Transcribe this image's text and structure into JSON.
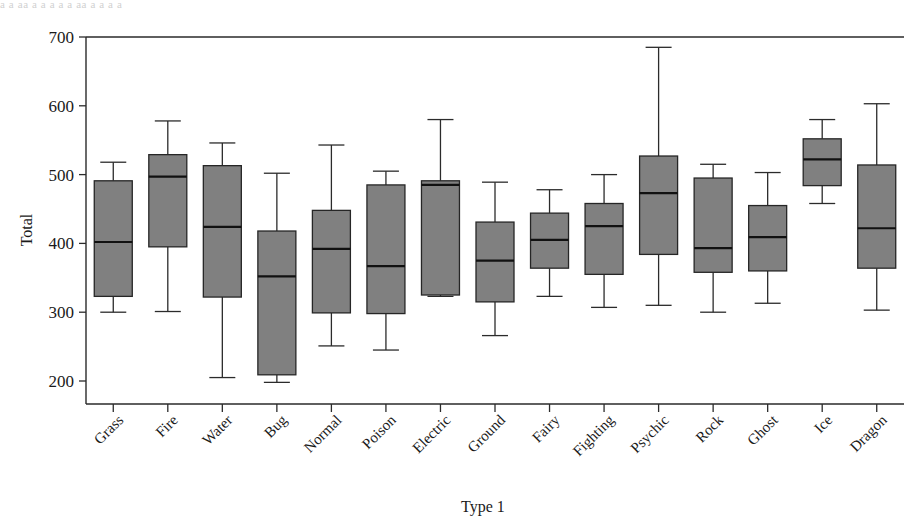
{
  "figure": {
    "top_partial_text": "a a aa a a   a  a  a  aa   a a  a   a",
    "background_color": "#ffffff",
    "box_fill_color": "#808080",
    "line_color": "#2b2b2b"
  },
  "chart_data": {
    "type": "box",
    "title": "",
    "xlabel": "Type 1",
    "ylabel": "Total",
    "ylim": [
      180,
      700
    ],
    "yticks": [
      200,
      300,
      400,
      500,
      600,
      700
    ],
    "ytick_labels": [
      "200",
      "300",
      "400",
      "500",
      "600",
      "700"
    ],
    "grid": false,
    "legend": "none",
    "categories": [
      "Grass",
      "Fire",
      "Water",
      "Bug",
      "Normal",
      "Poison",
      "Electric",
      "Ground",
      "Fairy",
      "Fighting",
      "Psychic",
      "Rock",
      "Ghost",
      "Ice",
      "Dragon"
    ],
    "boxes": [
      {
        "category": "Grass",
        "whisker_low": 300,
        "q1": 323,
        "median": 402,
        "q3": 491,
        "whisker_high": 518
      },
      {
        "category": "Fire",
        "whisker_low": 301,
        "q1": 395,
        "median": 497,
        "q3": 529,
        "whisker_high": 578
      },
      {
        "category": "Water",
        "whisker_low": 205,
        "q1": 322,
        "median": 424,
        "q3": 513,
        "whisker_high": 546
      },
      {
        "category": "Bug",
        "whisker_low": 198,
        "q1": 209,
        "median": 352,
        "q3": 418,
        "whisker_high": 502
      },
      {
        "category": "Normal",
        "whisker_low": 251,
        "q1": 299,
        "median": 392,
        "q3": 448,
        "whisker_high": 543
      },
      {
        "category": "Poison",
        "whisker_low": 245,
        "q1": 298,
        "median": 367,
        "q3": 485,
        "whisker_high": 505
      },
      {
        "category": "Electric",
        "whisker_low": 323,
        "q1": 325,
        "median": 485,
        "q3": 491,
        "whisker_high": 580
      },
      {
        "category": "Ground",
        "whisker_low": 266,
        "q1": 315,
        "median": 375,
        "q3": 431,
        "whisker_high": 489
      },
      {
        "category": "Fairy",
        "whisker_low": 323,
        "q1": 364,
        "median": 405,
        "q3": 444,
        "whisker_high": 478
      },
      {
        "category": "Fighting",
        "whisker_low": 307,
        "q1": 355,
        "median": 425,
        "q3": 458,
        "whisker_high": 500
      },
      {
        "category": "Psychic",
        "whisker_low": 310,
        "q1": 384,
        "median": 473,
        "q3": 527,
        "whisker_high": 685
      },
      {
        "category": "Rock",
        "whisker_low": 300,
        "q1": 358,
        "median": 393,
        "q3": 495,
        "whisker_high": 515
      },
      {
        "category": "Ghost",
        "whisker_low": 313,
        "q1": 360,
        "median": 409,
        "q3": 455,
        "whisker_high": 503
      },
      {
        "category": "Ice",
        "whisker_low": 458,
        "q1": 484,
        "median": 522,
        "q3": 552,
        "whisker_high": 580
      },
      {
        "category": "Dragon",
        "whisker_low": 303,
        "q1": 364,
        "median": 422,
        "q3": 514,
        "whisker_high": 603
      }
    ]
  }
}
